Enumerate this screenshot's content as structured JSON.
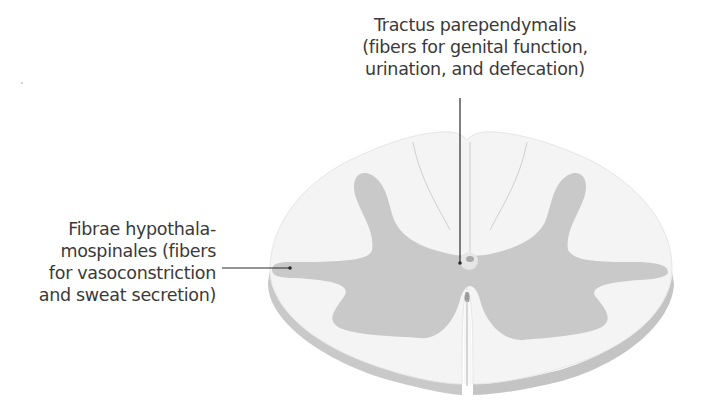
{
  "figure": {
    "colors": {
      "background": "#ffffff",
      "white_matter": "#f3f3f3",
      "grey_matter": "#c8c8c8",
      "cut_edge": "#bdbdbd",
      "leader_line": "#2b2b2b",
      "text": "#3a3a3a"
    }
  },
  "labels": {
    "top": {
      "lines": [
        "Tractus parependymalis",
        "(fibers for genital function,",
        "urination, and defecation)"
      ]
    },
    "left": {
      "lines": [
        "Fibrae hypothala-",
        "mospinales (fibers",
        "for vasoconstriction",
        "and sweat secretion)"
      ]
    }
  }
}
